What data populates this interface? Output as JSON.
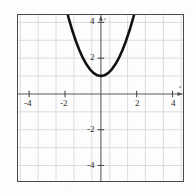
{
  "chart_data": {
    "type": "line",
    "title": "",
    "xlabel": "x",
    "ylabel": "y",
    "xlim": [
      -5.6,
      4.7
    ],
    "ylim": [
      -5.4,
      4.9
    ],
    "grid": true,
    "legend": null,
    "x_ticks": [
      -4,
      -2,
      2,
      4
    ],
    "y_ticks": [
      4,
      2,
      -2,
      -4
    ],
    "x_tick_labels": [
      "-4",
      "-2",
      "2",
      "4"
    ],
    "y_tick_labels": [
      "4",
      "2",
      "-2",
      "-4"
    ],
    "gridline_step": 1,
    "series": [
      {
        "name": "parabola",
        "equation": "y = x^2 + 1",
        "vertex": [
          0,
          1
        ],
        "color": "#111111",
        "x": [
          -1.95,
          -1.8,
          -1.6,
          -1.4,
          -1.2,
          -1.0,
          -0.8,
          -0.6,
          -0.4,
          -0.2,
          0,
          0.2,
          0.4,
          0.6,
          0.8,
          1.0,
          1.2,
          1.4,
          1.6,
          1.8,
          1.95
        ],
        "values": [
          4.8,
          4.24,
          3.56,
          2.96,
          2.44,
          2.0,
          1.64,
          1.36,
          1.16,
          1.04,
          1.0,
          1.04,
          1.16,
          1.36,
          1.64,
          2.0,
          2.44,
          2.96,
          3.56,
          4.24,
          4.8
        ]
      }
    ],
    "axis_arrows": {
      "x_positive": true,
      "y_positive": true
    }
  },
  "colors": {
    "curve": "#111111",
    "axis": "#5a5a5a",
    "grid": "#d8d8d8",
    "border": "#4a4a4a",
    "background": "#fdfdfd",
    "text": "#2b2b2b"
  },
  "axis_labels": {
    "x": "x",
    "y": "y"
  }
}
